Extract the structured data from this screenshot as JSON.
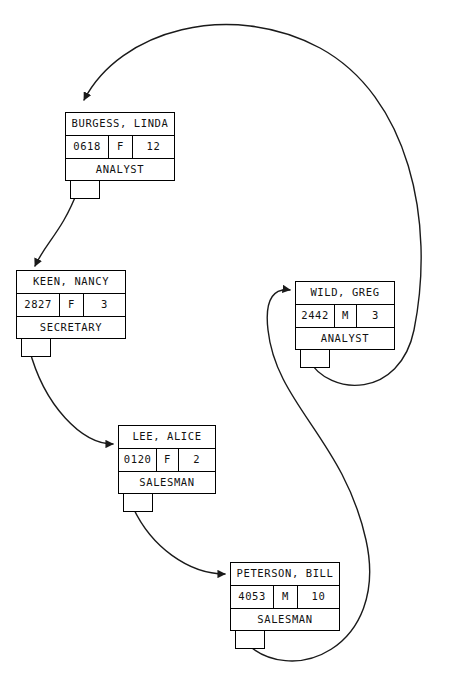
{
  "diagram": {
    "stroke_color": "#1a1a1a",
    "background_color": "#ffffff"
  },
  "nodes": [
    {
      "id": "burgess",
      "name": "BURGESS, LINDA",
      "emp_id": "0618",
      "sex": "F",
      "num": "12",
      "job": "ANALYST",
      "x": 65,
      "y": 112,
      "w": 110,
      "h": 65
    },
    {
      "id": "keen",
      "name": "KEEN, NANCY",
      "emp_id": "2827",
      "sex": "F",
      "num": "3",
      "job": "SECRETARY",
      "x": 16,
      "y": 270,
      "w": 110,
      "h": 65
    },
    {
      "id": "lee",
      "name": "LEE, ALICE",
      "emp_id": "0120",
      "sex": "F",
      "num": "2",
      "job": "SALESMAN",
      "x": 118,
      "y": 425,
      "w": 98,
      "h": 65
    },
    {
      "id": "peterson",
      "name": "PETERSON, BILL",
      "emp_id": "4053",
      "sex": "M",
      "num": "10",
      "job": "SALESMAN",
      "x": 230,
      "y": 562,
      "w": 110,
      "h": 65
    },
    {
      "id": "wild",
      "name": "WILD, GREG",
      "emp_id": "2442",
      "sex": "M",
      "num": "3",
      "job": "ANALYST",
      "x": 295,
      "y": 281,
      "w": 100,
      "h": 65
    }
  ],
  "stubs": [
    {
      "id": "burgess-stub",
      "x": 70,
      "y": 177,
      "w": 30,
      "h": 22
    },
    {
      "id": "keen-stub",
      "x": 21,
      "y": 335,
      "w": 30,
      "h": 22
    },
    {
      "id": "lee-stub",
      "x": 123,
      "y": 490,
      "w": 30,
      "h": 22
    },
    {
      "id": "peterson-stub",
      "x": 235,
      "y": 627,
      "w": 30,
      "h": 22
    },
    {
      "id": "wild-stub",
      "x": 300,
      "y": 346,
      "w": 30,
      "h": 22
    }
  ],
  "links": [
    {
      "id": "burgess-to-keen",
      "from": "burgess",
      "to": "keen",
      "path": "M 78 190 C 62 232 46 242 35 266"
    },
    {
      "id": "keen-to-lee",
      "from": "keen",
      "to": "lee",
      "path": "M 29 348 C 44 406 82 444 113 444"
    },
    {
      "id": "lee-to-peterson",
      "from": "lee",
      "to": "peterson",
      "path": "M 131 503 C 150 548 190 574 225 574"
    },
    {
      "id": "peterson-to-wild",
      "from": "peterson",
      "to": "wild",
      "path": "M 243 640 C 290 690 390 648 366 540 C 344 440 276 404 268 330 C 264 296 276 288 290 290"
    },
    {
      "id": "wild-to-burgess",
      "from": "wild",
      "to": "burgess",
      "path": "M 308 359 C 330 398 400 398 414 330 C 436 220 408 96 320 48 C 230 0 120 30 84 100"
    }
  ]
}
